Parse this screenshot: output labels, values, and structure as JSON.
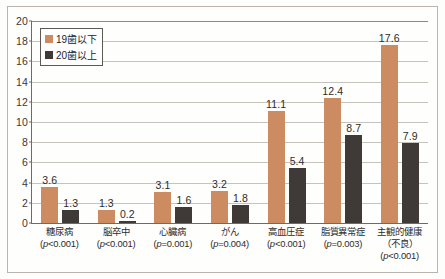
{
  "chart_data": {
    "type": "bar",
    "title": "",
    "xlabel": "",
    "ylabel": "",
    "ylim": [
      0,
      20
    ],
    "ytick_step": 2,
    "yticks": [
      20,
      18,
      16,
      14,
      12,
      10,
      8,
      6,
      4,
      2,
      0
    ],
    "grid": true,
    "legend_position": "top-left",
    "categories": [
      "糖尿病",
      "脳卒中",
      "心臓病",
      "がん",
      "高血圧症",
      "脂質異常症",
      "主観的健康"
    ],
    "category_details": [
      {
        "name": "糖尿病",
        "sub": "",
        "pvalue": "(p<0.001)"
      },
      {
        "name": "脳卒中",
        "sub": "",
        "pvalue": "(p<0.001)"
      },
      {
        "name": "心臓病",
        "sub": "",
        "pvalue": "(p=0.001)"
      },
      {
        "name": "がん",
        "sub": "",
        "pvalue": "(p=0.004)"
      },
      {
        "name": "高血圧症",
        "sub": "",
        "pvalue": "(p<0.001)"
      },
      {
        "name": "脂質異常症",
        "sub": "",
        "pvalue": "(p=0.003)"
      },
      {
        "name": "主観的健康",
        "sub": "（不良）",
        "pvalue": "(p<0.001)"
      }
    ],
    "series": [
      {
        "name": "19歯以下",
        "color": "#cd8b62",
        "values": [
          3.6,
          1.3,
          3.1,
          3.2,
          11.1,
          12.4,
          17.6
        ]
      },
      {
        "name": "20歯以上",
        "color": "#3f3a38",
        "values": [
          1.3,
          0.2,
          1.6,
          1.8,
          5.4,
          8.7,
          7.9
        ]
      }
    ],
    "value_labels": {
      "series0": [
        "3.6",
        "1.3",
        "3.1",
        "3.2",
        "11.1",
        "12.4",
        "17.6"
      ],
      "series1": [
        "1.3",
        "0.2",
        "1.6",
        "1.8",
        "5.4",
        "8.7",
        "7.9"
      ]
    }
  },
  "legend": {
    "items": [
      {
        "label": "19歯以下",
        "color": "#cd8b62"
      },
      {
        "label": "20歯以上",
        "color": "#3f3a38"
      }
    ]
  },
  "colors": {
    "series_19": "#cd8b62",
    "series_20": "#3f3a38",
    "grid": "#c6c3bd",
    "axis": "#6e6a66",
    "frame": "#b9b5ae",
    "background": "#fefefd",
    "text": "#2e2b29"
  }
}
